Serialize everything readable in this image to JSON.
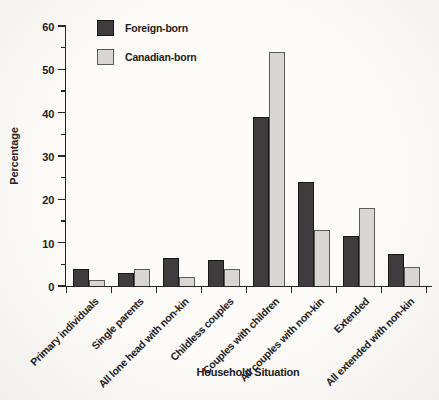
{
  "chart_data": {
    "type": "bar",
    "title": "",
    "xlabel": "Household Situation",
    "ylabel": "Percentage",
    "ylim": [
      0,
      60
    ],
    "ytick_major": 10,
    "ytick_minor": 5,
    "grid": false,
    "legend_position": "top-left-inside",
    "categories": [
      "Primary individuals",
      "Single parents",
      "All lone head with non-kin",
      "Childless couples",
      "Couples with children",
      "All couples with non-kin",
      "Extended",
      "All extended with non-kin"
    ],
    "series": [
      {
        "name": "Foreign-born",
        "color": "#3e3c3d",
        "border_color": "#171516",
        "values": [
          4,
          3,
          6.5,
          6,
          39,
          24,
          11.5,
          7.5
        ]
      },
      {
        "name": "Canadian-born",
        "color": "#d7d6d2",
        "border_color": "#5c5a5b",
        "values": [
          1.5,
          4,
          2,
          4,
          54,
          13,
          18,
          4.5
        ]
      }
    ]
  },
  "colors": {
    "axis": "#2a2627",
    "text": "#232021",
    "paper_background": "#fcfbf7"
  }
}
